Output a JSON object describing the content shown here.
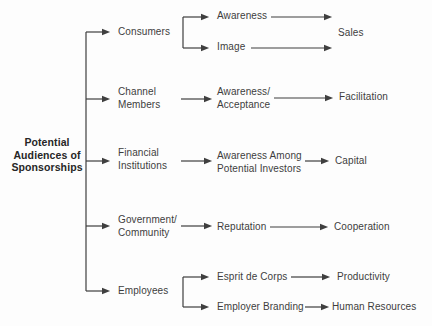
{
  "diagram": {
    "root": {
      "label": "Potential\nAudiences of\nSponsorships"
    },
    "audiences": [
      {
        "label": "Consumers"
      },
      {
        "label": "Channel\nMembers"
      },
      {
        "label": "Financial\nInstitutions"
      },
      {
        "label": "Government/\nCommunity"
      },
      {
        "label": "Employees"
      }
    ],
    "mediators": [
      {
        "label": "Awareness"
      },
      {
        "label": "Image"
      },
      {
        "label": "Awareness/\nAcceptance"
      },
      {
        "label": "Awareness Among\nPotential Investors"
      },
      {
        "label": "Reputation"
      },
      {
        "label": "Esprit de Corps"
      },
      {
        "label": "Employer Branding"
      }
    ],
    "outcomes": [
      {
        "label": "Sales"
      },
      {
        "label": "Facilitation"
      },
      {
        "label": "Capital"
      },
      {
        "label": "Cooperation"
      },
      {
        "label": "Productivity"
      },
      {
        "label": "Human Resources"
      }
    ],
    "relationships": [
      {
        "audience": "Consumers",
        "via": [
          "Awareness",
          "Image"
        ],
        "outcomes": [
          "Sales"
        ]
      },
      {
        "audience": "Channel Members",
        "via": [
          "Awareness/Acceptance"
        ],
        "outcomes": [
          "Facilitation"
        ]
      },
      {
        "audience": "Financial Institutions",
        "via": [
          "Awareness Among Potential Investors"
        ],
        "outcomes": [
          "Capital"
        ]
      },
      {
        "audience": "Government/Community",
        "via": [
          "Reputation"
        ],
        "outcomes": [
          "Cooperation"
        ]
      },
      {
        "audience": "Employees",
        "via": [
          "Esprit de Corps",
          "Employer Branding"
        ],
        "outcomes": [
          "Productivity",
          "Human Resources"
        ]
      }
    ],
    "colors": {
      "background": "#fdfdfd",
      "text": "#3d3d3d",
      "root_text": "#262626",
      "line": "#3f3f3f"
    }
  }
}
